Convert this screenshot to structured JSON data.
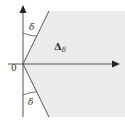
{
  "diagram": {
    "origin_label": "0",
    "angle_label_upper": "δ",
    "angle_label_lower": "δ",
    "region_label_main": "Δ",
    "region_label_sub": "δ",
    "colors": {
      "region_fill": "#ebebeb",
      "axis": "#555555",
      "ray": "#555555",
      "text": "#333333",
      "background": "#ffffff"
    }
  }
}
